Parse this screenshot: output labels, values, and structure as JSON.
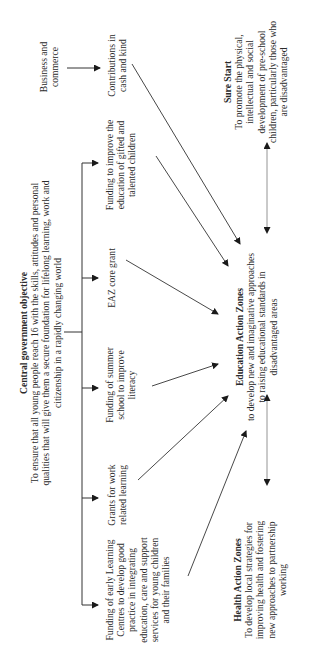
{
  "diagram": {
    "central": {
      "title": "Central government objective",
      "text": "To ensure that all young people reach 16 with the skills, attitudes and personal qualities that will give them a secure foundation for lifelong learning, work and citizenship in a rapidly changing world"
    },
    "funding_items": [
      {
        "id": "gifted",
        "text": "Funding to improve the education of gifted and talented children"
      },
      {
        "id": "eaz-core",
        "text": "EAZ core grant"
      },
      {
        "id": "summer",
        "text": "Funding of summer school to improve literacy"
      },
      {
        "id": "work",
        "text": "Grants for work related learning"
      },
      {
        "id": "early",
        "text": "Funding of early Learning Centres to develop good practice in integrating education, care and support services for young children and their families"
      }
    ],
    "business": {
      "text": "Business and commerce"
    },
    "contributions": {
      "text": "Contributions in cash and kind"
    },
    "eaz": {
      "title": "Education Action Zones",
      "text": "to develop new and imaginative approaches to raising educational standards in disadvantaged areas"
    },
    "sure_start": {
      "title": "Sure Start",
      "text": "To promote the physical, intellectual and social development of pre-school children, particularly those who are disadvantaged"
    },
    "haz": {
      "title": "Health Action Zones",
      "text": "To develop local strategies for improving health and fostering new approaches to partnership working"
    },
    "orientation": "rotated 90° counter-clockwise"
  }
}
